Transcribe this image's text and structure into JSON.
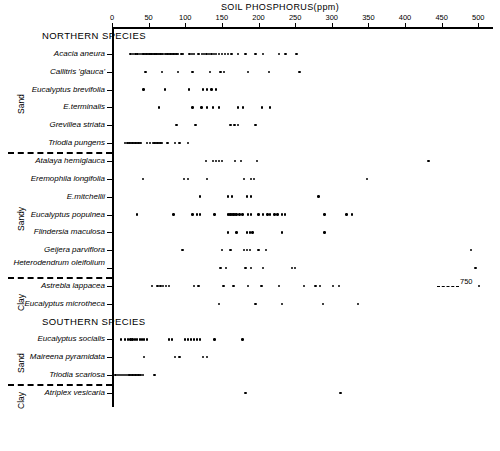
{
  "chart_data": {
    "type": "scatter",
    "title": "SOIL PHOSPHORUS(ppm)",
    "xlabel": "SOIL PHOSPHORUS(ppm)",
    "ylabel": "",
    "xlim": [
      0,
      520
    ],
    "xticks": [
      0,
      50,
      100,
      150,
      200,
      250,
      300,
      350,
      400,
      450,
      500
    ],
    "xtick_labels": [
      "0",
      "50",
      "100",
      "150",
      "200",
      "250",
      "300",
      "350",
      "400",
      "450",
      "500"
    ],
    "grid": false,
    "legend": null,
    "section_headers": [
      {
        "label": "NORTHERN SPECIES",
        "row_index": 0
      },
      {
        "label": "SOUTHERN SPECIES",
        "row_index": 16
      }
    ],
    "soil_groups": [
      {
        "label": "Sand",
        "first_row": 1,
        "last_row": 6
      },
      {
        "label": "Sandy",
        "first_row": 7,
        "last_row": 13
      },
      {
        "label": "Clay",
        "first_row": 14,
        "last_row": 15
      },
      {
        "label": "Sand",
        "first_row": 17,
        "last_row": 19
      },
      {
        "label": "Clay",
        "first_row": 20,
        "last_row": 20
      }
    ],
    "separators_after_row": [
      6,
      13,
      19
    ],
    "annotations": [
      {
        "text": "750",
        "row_label": "Astrebla lappacea",
        "note": "off-scale value shown with dashed lead line at right edge"
      }
    ],
    "series": [
      {
        "name": "Acacia aneura",
        "values": [
          25,
          29,
          32,
          35,
          38,
          41,
          43,
          45,
          47,
          49,
          51,
          52,
          54,
          55,
          57,
          58,
          60,
          61,
          63,
          64,
          66,
          68,
          70,
          72,
          74,
          76,
          78,
          80,
          82,
          84,
          86,
          88,
          90,
          95,
          97,
          106,
          109,
          112,
          118,
          123,
          126,
          129,
          132,
          136,
          139,
          142,
          146,
          150,
          154,
          158,
          163,
          172,
          182,
          196,
          206,
          228,
          237,
          252
        ]
      },
      {
        "name": "Callitris 'glauca'",
        "values": [
          46,
          68,
          90,
          110,
          134,
          148,
          153,
          186,
          214,
          256
        ]
      },
      {
        "name": "Eucalyptus brevifolia",
        "values": [
          43,
          72,
          105,
          124,
          130,
          136,
          142
        ]
      },
      {
        "name": "E.terminalis",
        "values": [
          64,
          110,
          122,
          130,
          138,
          146,
          172,
          179,
          205,
          216
        ]
      },
      {
        "name": "Grevillea striata",
        "values": [
          88,
          114,
          162,
          167,
          172,
          196
        ]
      },
      {
        "name": "Triodia pungens",
        "values": [
          18,
          21,
          24,
          26,
          28,
          30,
          32,
          34,
          36,
          38,
          40,
          48,
          52,
          56,
          58,
          60,
          62,
          64,
          66,
          68,
          76,
          86,
          92,
          104
        ]
      },
      {
        "name": "Atalaya hemiglauca",
        "values": [
          128,
          138,
          142,
          146,
          150,
          168,
          176,
          198,
          432
        ]
      },
      {
        "name": "Eremophila longifolia",
        "values": [
          42,
          98,
          104,
          130,
          180,
          190,
          194,
          348
        ]
      },
      {
        "name": "E.mitchellii",
        "values": [
          120,
          158,
          164,
          184,
          190,
          282
        ]
      },
      {
        "name": "Eucalyptus populnea",
        "values": [
          34,
          84,
          110,
          116,
          120,
          140,
          158,
          160,
          162,
          164,
          166,
          168,
          170,
          174,
          178,
          186,
          190,
          200,
          206,
          212,
          216,
          222,
          226,
          232,
          236,
          290,
          320,
          328
        ]
      },
      {
        "name": "Flindersia maculosa",
        "values": [
          158,
          170,
          184,
          188,
          192,
          232,
          290
        ]
      },
      {
        "name": "Geijera parviflora",
        "values": [
          96,
          150,
          162,
          180,
          184,
          188,
          200,
          210,
          490
        ]
      },
      {
        "name": "Heterodendrum oleifolium",
        "values": [
          148,
          156,
          182,
          190,
          206,
          246,
          250,
          496
        ]
      },
      {
        "name": "Astrebla lappacea",
        "values": [
          55,
          62,
          66,
          70,
          74,
          78,
          112,
          118,
          152,
          166,
          186,
          204,
          228,
          262,
          278,
          284,
          302,
          310,
          750
        ]
      },
      {
        "name": "Eucalyptus microtheca",
        "values": [
          146,
          196,
          232,
          288,
          336
        ]
      },
      {
        "name": "Eucalyptus socialis",
        "values": [
          12,
          18,
          22,
          25,
          28,
          31,
          34,
          38,
          41,
          44,
          48,
          78,
          82,
          100,
          104,
          108,
          112,
          116,
          120,
          140,
          178
        ]
      },
      {
        "name": "Maireena pyramidata",
        "values": [
          44,
          86,
          92,
          124,
          130
        ]
      },
      {
        "name": "Triodia scariosa",
        "values": [
          5,
          8,
          11,
          14,
          16,
          19,
          22,
          24,
          26,
          28,
          30,
          32,
          34,
          36,
          38,
          40,
          42,
          58
        ]
      },
      {
        "name": "Atriplex vesicaria",
        "values": [
          182,
          312
        ]
      }
    ]
  },
  "rows": [
    {
      "label": "NORTHERN SPECIES",
      "type": "header"
    },
    {
      "label": "Acacia aneura",
      "type": "species"
    },
    {
      "label": "Callitris 'glauca'",
      "type": "species"
    },
    {
      "label": "Eucalyptus brevifolia",
      "type": "species"
    },
    {
      "label": "E.terminalis",
      "type": "species"
    },
    {
      "label": "Grevillea striata",
      "type": "species"
    },
    {
      "label": "Triodia pungens",
      "type": "species"
    },
    {
      "label": "Atalaya hemiglauca",
      "type": "species"
    },
    {
      "label": "Eremophila longifolia",
      "type": "species"
    },
    {
      "label": "E.mitchellii",
      "type": "species"
    },
    {
      "label": "Eucalyptus populnea",
      "type": "species"
    },
    {
      "label": "Flindersia maculosa",
      "type": "species"
    },
    {
      "label": "Geijera parviflora",
      "type": "species"
    },
    {
      "label": "Heterodendrum oleifolium",
      "type": "species"
    },
    {
      "label": "Astrebla lappacea",
      "type": "species"
    },
    {
      "label": "Eucalyptus microtheca",
      "type": "species"
    },
    {
      "label": "SOUTHERN SPECIES",
      "type": "header"
    },
    {
      "label": "Eucalyptus socialis",
      "type": "species"
    },
    {
      "label": "Maireena pyramidata",
      "type": "species"
    },
    {
      "label": "Triodia scariosa",
      "type": "species"
    },
    {
      "label": "Atriplex vesicaria",
      "type": "species"
    }
  ],
  "colors": {
    "ink": "#000000",
    "background": "#ffffff"
  }
}
